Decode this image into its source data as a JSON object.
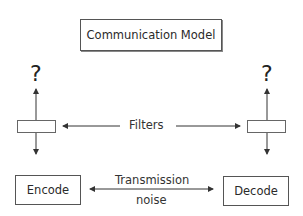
{
  "diagram": {
    "title": "Communication Model",
    "left_question": "?",
    "right_question": "?",
    "filters_label": "Filters",
    "encode_label": "Encode",
    "decode_label": "Decode",
    "transmission_line1": "Transmission",
    "transmission_line2": "noise",
    "colors": {
      "line": "#333333",
      "box_border": "#555555",
      "text": "#2a2a2a"
    }
  }
}
